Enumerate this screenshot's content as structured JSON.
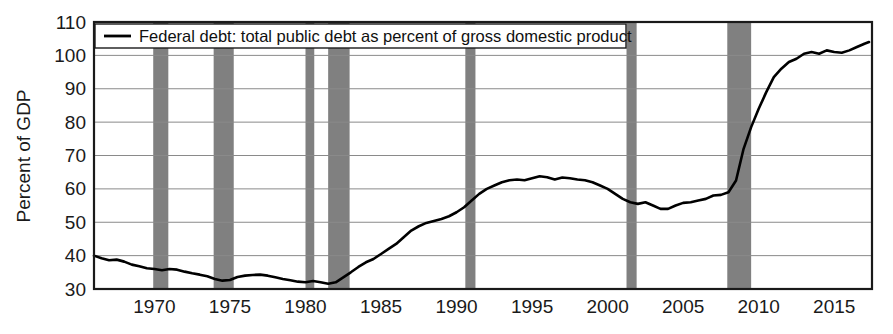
{
  "chart_data": {
    "type": "line",
    "title": "",
    "xlabel": "",
    "ylabel": "Percent of GDP",
    "xlim": [
      1966.0,
      2017.5
    ],
    "ylim": [
      30,
      110
    ],
    "yticks": [
      30,
      40,
      50,
      60,
      70,
      80,
      90,
      100,
      110
    ],
    "xticks": [
      1970,
      1975,
      1980,
      1985,
      1990,
      1995,
      2000,
      2005,
      2010,
      2015
    ],
    "grid": "horizontal",
    "legend_position": "top-left",
    "legend_entries": [
      "Federal debt: total public debt as percent of gross domestic product"
    ],
    "series": [
      {
        "name": "Federal debt: total public debt as percent of gross domestic product",
        "color": "#000000",
        "x": [
          1966.0,
          1966.5,
          1967.0,
          1967.5,
          1968.0,
          1968.5,
          1969.0,
          1969.5,
          1970.0,
          1970.5,
          1971.0,
          1971.5,
          1972.0,
          1972.5,
          1973.0,
          1973.5,
          1974.0,
          1974.5,
          1975.0,
          1975.5,
          1976.0,
          1976.5,
          1977.0,
          1977.5,
          1978.0,
          1978.5,
          1979.0,
          1979.5,
          1980.0,
          1980.5,
          1981.0,
          1981.5,
          1982.0,
          1982.5,
          1983.0,
          1983.5,
          1984.0,
          1984.5,
          1985.0,
          1985.5,
          1986.0,
          1986.5,
          1987.0,
          1987.5,
          1988.0,
          1988.5,
          1989.0,
          1989.5,
          1990.0,
          1990.5,
          1991.0,
          1991.5,
          1992.0,
          1992.5,
          1993.0,
          1993.5,
          1994.0,
          1994.5,
          1995.0,
          1995.5,
          1996.0,
          1996.5,
          1997.0,
          1997.5,
          1998.0,
          1998.5,
          1999.0,
          1999.5,
          2000.0,
          2000.5,
          2001.0,
          2001.5,
          2002.0,
          2002.5,
          2003.0,
          2003.5,
          2004.0,
          2004.5,
          2005.0,
          2005.5,
          2006.0,
          2006.5,
          2007.0,
          2007.5,
          2008.0,
          2008.5,
          2009.0,
          2009.5,
          2010.0,
          2010.5,
          2011.0,
          2011.5,
          2012.0,
          2012.5,
          2013.0,
          2013.5,
          2014.0,
          2014.5,
          2015.0,
          2015.5,
          2016.0,
          2016.5,
          2017.0,
          2017.3
        ],
        "y": [
          40.0,
          39.2,
          38.6,
          38.8,
          38.2,
          37.3,
          36.8,
          36.2,
          36.0,
          35.6,
          36.0,
          35.8,
          35.2,
          34.7,
          34.3,
          33.8,
          33.0,
          32.5,
          32.7,
          33.6,
          34.0,
          34.2,
          34.3,
          34.0,
          33.5,
          33.0,
          32.6,
          32.2,
          32.0,
          32.4,
          32.0,
          31.6,
          32.0,
          33.5,
          35.0,
          36.6,
          38.0,
          39.0,
          40.5,
          42.0,
          43.5,
          45.5,
          47.5,
          48.8,
          49.8,
          50.4,
          51.0,
          51.8,
          53.0,
          54.5,
          56.5,
          58.5,
          60.0,
          61.0,
          62.0,
          62.6,
          62.8,
          62.6,
          63.2,
          63.8,
          63.5,
          62.8,
          63.4,
          63.2,
          62.8,
          62.6,
          62.0,
          61.0,
          60.0,
          58.5,
          57.0,
          56.0,
          55.5,
          56.0,
          55.0,
          54.0,
          54.0,
          55.0,
          55.8,
          56.0,
          56.5,
          57.0,
          58.0,
          58.2,
          59.0,
          62.5,
          72.0,
          78.5,
          84.0,
          89.0,
          93.5,
          96.0,
          98.0,
          99.0,
          100.5,
          101.0,
          100.5,
          101.5,
          101.0,
          100.8,
          101.5,
          102.5,
          103.5,
          104.0
        ]
      }
    ],
    "recession_bands": [
      {
        "start": 1969.92,
        "end": 1970.92,
        "label": "1970 recession"
      },
      {
        "start": 1973.92,
        "end": 1975.25,
        "label": "1973-75 recession"
      },
      {
        "start": 1980.0,
        "end": 1980.58,
        "label": "1980 recession"
      },
      {
        "start": 1981.5,
        "end": 1982.92,
        "label": "1981-82 recession"
      },
      {
        "start": 1990.58,
        "end": 1991.25,
        "label": "1990-91 recession"
      },
      {
        "start": 2001.25,
        "end": 2001.92,
        "label": "2001 recession"
      },
      {
        "start": 2007.92,
        "end": 2009.5,
        "label": "2008-09 recession"
      }
    ],
    "recession_band_color": "#808080",
    "grid_color": "#8a8a8a",
    "axis_color": "#1a1a1a",
    "background_color": "#ffffff"
  },
  "yaxis": {
    "title": "Percent of GDP",
    "ticks": [
      "110",
      "100",
      "90",
      "80",
      "70",
      "60",
      "50",
      "40",
      "30"
    ]
  },
  "xaxis": {
    "ticks": [
      "1970",
      "1975",
      "1980",
      "1985",
      "1990",
      "1995",
      "2000",
      "2005",
      "2010",
      "2015"
    ]
  },
  "legend": {
    "entry_label": "Federal debt: total public debt as percent of gross domestic product"
  }
}
